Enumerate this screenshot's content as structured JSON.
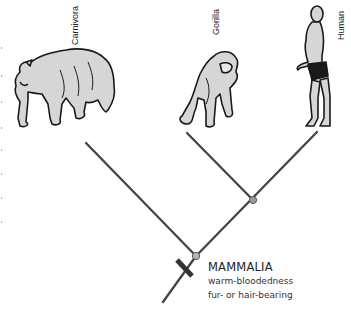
{
  "diagram": {
    "type": "cladogram",
    "taxa": [
      {
        "label": "Carnivora",
        "illustration": "bear"
      },
      {
        "label": "Gorilla",
        "illustration": "gorilla"
      },
      {
        "label": "Human",
        "illustration": "human"
      }
    ],
    "clade": {
      "name": "MAMMALIA",
      "traits": [
        "warm-bloodedness",
        "fur- or hair-bearing"
      ]
    },
    "colors": {
      "line": "#444444",
      "node": "#9a9a9a",
      "animal_fill": "#d6d6d6",
      "animal_outline": "#1a1a1a"
    }
  }
}
